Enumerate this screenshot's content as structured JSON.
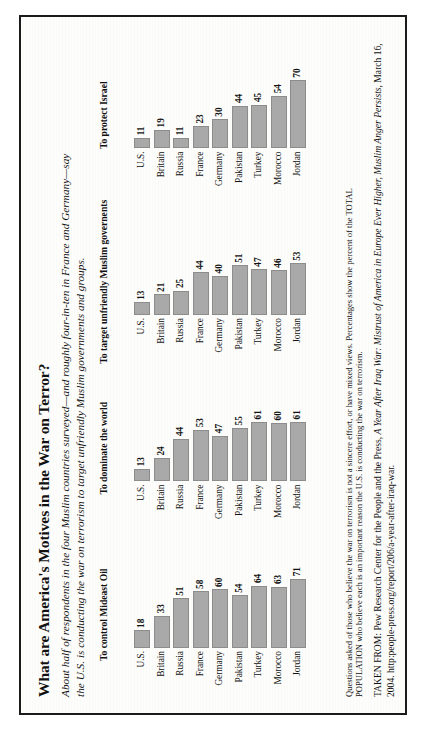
{
  "title": "What are America's Motives in the War on Terror?",
  "subtitle": {
    "line1": "About half of respondents in the four Muslim countries surveyed—and roughly four-in-ten in France and Germany—say",
    "line2": "the U.S. is conducting the war on terrorism to target unfriendly Muslim governments and groups."
  },
  "notes": {
    "line1": "Questions asked of those who believe the war on terrorism is not a sincere effort, or have mixed views. Percentages show the percent of the TOTAL",
    "line2": "POPULATION who believe each is an important reason the U.S. is conducting the war on terrorism."
  },
  "source": {
    "prefix": "TAKEN FROM: Pew Research Center for the People and the Press, ",
    "work": "A Year After Iraq War: Mistrust of America in Europe Ever Higher, Muslim Anger Persists",
    "suffix": ", March 16, 2004. http:people-press.org/report/206/a-year-after-iraq-war."
  },
  "colors": {
    "bar_fill": "#a9a9a9",
    "bar_stroke": "#8d8d8d",
    "page": "#fdfdfb",
    "frame": "#1b1b1b",
    "ink": "#111111"
  },
  "chart_data": [
    {
      "type": "bar",
      "title": "To control Mideast Oil",
      "orientation": "horizontal",
      "categories": [
        "U.S.",
        "Britain",
        "Russia",
        "France",
        "Germany",
        "Pakistan",
        "Turkey",
        "Morocco",
        "Jordan"
      ],
      "values": [
        18,
        33,
        51,
        58,
        60,
        54,
        64,
        63,
        71
      ],
      "xlabel": "",
      "ylabel": "",
      "xlim": [
        0,
        80
      ],
      "grid": false,
      "legend": "none",
      "data_labels": true
    },
    {
      "type": "bar",
      "title": "To dominate the world",
      "orientation": "horizontal",
      "categories": [
        "U.S.",
        "Britain",
        "Russia",
        "France",
        "Germany",
        "Pakistan",
        "Turkey",
        "Morocco",
        "Jordan"
      ],
      "values": [
        13,
        24,
        44,
        53,
        47,
        55,
        61,
        60,
        61
      ],
      "xlabel": "",
      "ylabel": "",
      "xlim": [
        0,
        80
      ],
      "grid": false,
      "legend": "none",
      "data_labels": true
    },
    {
      "type": "bar",
      "title": "To target unfriendly Muslim governents",
      "orientation": "horizontal",
      "categories": [
        "U.S.",
        "Britain",
        "Russia",
        "France",
        "Germany",
        "Pakistan",
        "Turkey",
        "Morocco",
        "Jordan"
      ],
      "values": [
        13,
        21,
        25,
        44,
        40,
        51,
        47,
        46,
        53
      ],
      "xlabel": "",
      "ylabel": "",
      "xlim": [
        0,
        80
      ],
      "grid": false,
      "legend": "none",
      "data_labels": true
    },
    {
      "type": "bar",
      "title": "To protect Israel",
      "orientation": "horizontal",
      "categories": [
        "U.S.",
        "Britain",
        "Russia",
        "France",
        "Germany",
        "Pakistan",
        "Turkey",
        "Morocco",
        "Jordan"
      ],
      "values": [
        11,
        19,
        11,
        23,
        30,
        44,
        45,
        54,
        70
      ],
      "xlabel": "",
      "ylabel": "",
      "xlim": [
        0,
        80
      ],
      "grid": false,
      "legend": "none",
      "data_labels": true
    }
  ]
}
